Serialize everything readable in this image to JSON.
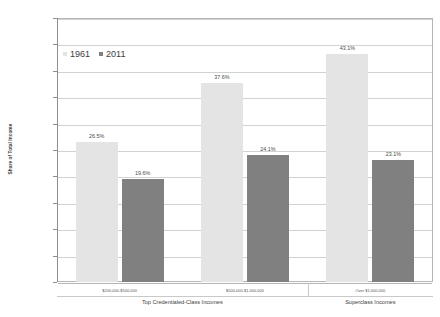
{
  "chart_data": {
    "type": "bar",
    "title": "",
    "subtitle": "",
    "xlabel": "",
    "ylabel": "Share of Total Income",
    "ylim": [
      0,
      50
    ],
    "ytick_labels": [
      "50%",
      "45%",
      "40%",
      "35%",
      "30%",
      "25%",
      "20%",
      "15%",
      "10%",
      "5%",
      "0%"
    ],
    "ytick_values": [
      50,
      45,
      40,
      35,
      30,
      25,
      20,
      15,
      10,
      5,
      0
    ],
    "grid": true,
    "legend_position": "inside-upper-left",
    "categories": [
      "$200,000-$500,000",
      "$500,000-$1,000,000",
      "Over $1,000,000"
    ],
    "group_labels": [
      "Top Credentialed-Class Incomes",
      "Superclass Incomes"
    ],
    "series": [
      {
        "name": "1961",
        "color": "#e4e4e4",
        "values": [
          26.5,
          37.6,
          43.1
        ],
        "value_labels": [
          "26.5%",
          "37.6%",
          "43.1%"
        ]
      },
      {
        "name": "2011",
        "color": "#808080",
        "values": [
          19.6,
          24.1,
          23.1
        ],
        "value_labels": [
          "19.6%",
          "24.1%",
          "23.1%"
        ]
      }
    ]
  },
  "legend": {
    "entries": [
      {
        "label": "1961",
        "swatch_color": "#e4e4e4"
      },
      {
        "label": "2011",
        "swatch_color": "#808080"
      }
    ]
  },
  "axis": {
    "y_title": "Share of Total Income"
  }
}
